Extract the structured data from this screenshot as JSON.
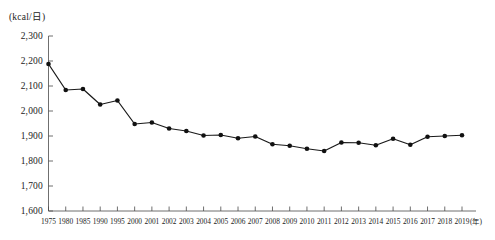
{
  "chart_data": {
    "type": "line",
    "title": "",
    "subtitle": "",
    "xlabel": "(年)",
    "ylabel": "(kcal/日)",
    "unit_label": "(kcal/日)",
    "x_unit_suffix": "(年)",
    "ylim": [
      1600,
      2300
    ],
    "ytick_values": [
      1600,
      1700,
      1800,
      1900,
      2000,
      2100,
      2200,
      2300
    ],
    "ytick_labels": [
      "1,600",
      "1,700",
      "1,800",
      "1,900",
      "2,000",
      "2,100",
      "2,200",
      "2,300"
    ],
    "grid": false,
    "legend": "none",
    "categories": [
      "1975",
      "1980",
      "1985",
      "1990",
      "1995",
      "2000",
      "2001",
      "2002",
      "2003",
      "2004",
      "2005",
      "2006",
      "2007",
      "2008",
      "2009",
      "2010",
      "2011",
      "2012",
      "2013",
      "2014",
      "2015",
      "2016",
      "2017",
      "2018",
      "2019"
    ],
    "values": [
      2188,
      2084,
      2088,
      2026,
      2042,
      1948,
      1954,
      1930,
      1920,
      1902,
      1904,
      1891,
      1898,
      1867,
      1861,
      1849,
      1840,
      1874,
      1873,
      1863,
      1889,
      1865,
      1897,
      1900,
      1903
    ],
    "series": [
      {
        "name": "エネルギー摂取量",
        "values": [
          2188,
          2084,
          2088,
          2026,
          2042,
          1948,
          1954,
          1930,
          1920,
          1902,
          1904,
          1891,
          1898,
          1867,
          1861,
          1849,
          1840,
          1874,
          1873,
          1863,
          1889,
          1865,
          1897,
          1900,
          1903
        ]
      }
    ],
    "marker": "circle",
    "line_color": "#1a1a1a",
    "marker_color": "#111111"
  },
  "axes": {
    "y_axis_name": "y-axis",
    "x_axis_name": "x-axis"
  }
}
